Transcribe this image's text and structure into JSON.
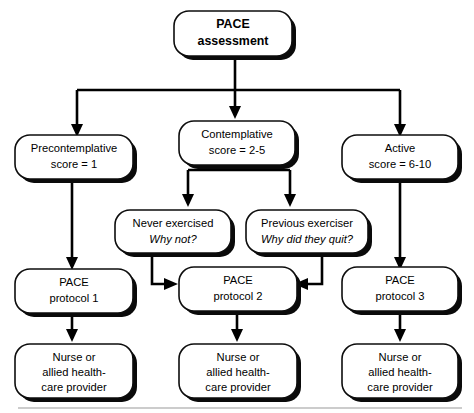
{
  "diagram": {
    "colors": {
      "stroke": "#0d0d0d",
      "fill": "#ffffff",
      "shadow": "#0a0a0a",
      "rule": "#9a9a9a"
    },
    "nodes": {
      "root": {
        "line1": "PACE",
        "line2": "assessment"
      },
      "precontemplative": {
        "line1": "Precontemplative",
        "line2": "score = 1"
      },
      "contemplative": {
        "line1": "Contemplative",
        "line2": "score = 2-5"
      },
      "active": {
        "line1": "Active",
        "line2": "score = 6-10"
      },
      "never_exercised": {
        "line1": "Never exercised",
        "line2": "Why not?"
      },
      "previous_exerciser": {
        "line1": "Previous exerciser",
        "line2": "Why did they quit?"
      },
      "protocol1": {
        "line1": "PACE",
        "line2": "protocol 1"
      },
      "protocol2": {
        "line1": "PACE",
        "line2": "protocol 2"
      },
      "protocol3": {
        "line1": "PACE",
        "line2": "protocol 3"
      },
      "provider1": {
        "line1": "Nurse  or",
        "line2": "allied health-",
        "line3": "care provider"
      },
      "provider2": {
        "line1": "Nurse or",
        "line2": "allied health-",
        "line3": "care provider"
      },
      "provider3": {
        "line1": "Nurse or",
        "line2": "allied health-",
        "line3": "care provider"
      }
    }
  }
}
